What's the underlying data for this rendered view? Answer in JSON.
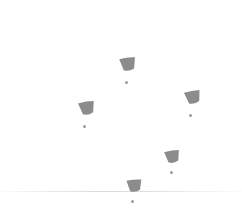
{
  "scene": {
    "title": "Grey wedge marker field",
    "width": 242,
    "height": 224,
    "background_color": "#ffffff"
  },
  "horizon_line": {
    "name": "horizon-line",
    "y": 191,
    "color": "#cdcdd2",
    "opacity": 0.85
  },
  "markers": [
    {
      "id": "marker-top",
      "label": "wedge-marker-top",
      "wedge": {
        "x": 119,
        "y": 57,
        "width": 18,
        "height": 15,
        "fill": "#8c8c8c",
        "rotation": -8
      },
      "dot": {
        "x": 125,
        "y": 81,
        "size": 3,
        "fill": "#9a9a9a"
      }
    },
    {
      "id": "marker-right",
      "label": "wedge-marker-right",
      "wedge": {
        "x": 184,
        "y": 90,
        "width": 18,
        "height": 15,
        "fill": "#8c8c8c",
        "rotation": -12
      },
      "dot": {
        "x": 189,
        "y": 114,
        "size": 3,
        "fill": "#9a9a9a"
      }
    },
    {
      "id": "marker-left",
      "label": "wedge-marker-left",
      "wedge": {
        "x": 78,
        "y": 101,
        "width": 18,
        "height": 15,
        "fill": "#8c8c8c",
        "rotation": -10
      },
      "dot": {
        "x": 83,
        "y": 125,
        "size": 3,
        "fill": "#9a9a9a"
      }
    },
    {
      "id": "marker-lower-right",
      "label": "wedge-marker-lower-right",
      "wedge": {
        "x": 164,
        "y": 150,
        "width": 17,
        "height": 14,
        "fill": "#8c8c8c",
        "rotation": -10
      },
      "dot": {
        "x": 170,
        "y": 171,
        "size": 3,
        "fill": "#9a9a9a"
      }
    },
    {
      "id": "marker-bottom",
      "label": "wedge-marker-bottom",
      "wedge": {
        "x": 126,
        "y": 179,
        "width": 17,
        "height": 14,
        "fill": "#8c8c8c",
        "rotation": -6
      },
      "dot": {
        "x": 131,
        "y": 200,
        "size": 3,
        "fill": "#9a9a9a"
      }
    }
  ]
}
